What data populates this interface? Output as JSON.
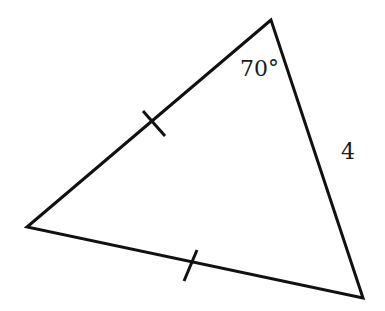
{
  "diagram": {
    "type": "triangle",
    "vertices": {
      "top": [
        271,
        20
      ],
      "left": [
        27,
        227
      ],
      "bottom_right": [
        363,
        298
      ]
    },
    "angle_label": "70°",
    "side_label": "4",
    "tick_marks": [
      {
        "side": "top-left",
        "from": [
          143,
          111
        ],
        "to": [
          165,
          136
        ]
      },
      {
        "side": "left-bottom",
        "from": [
          197,
          250
        ],
        "to": [
          184,
          281
        ]
      }
    ],
    "stroke_color": "#111111"
  }
}
